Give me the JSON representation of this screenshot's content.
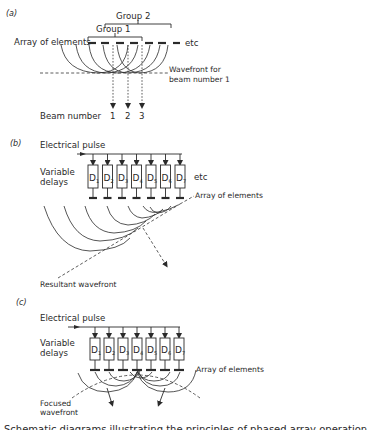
{
  "figure": {
    "panels": [
      {
        "tag": "(a)",
        "labels": {
          "array": "Array of elements",
          "etc": "etc",
          "group1": "Group 1",
          "group2": "Group 2",
          "wavefront_line1": "Wavefront for",
          "wavefront_line2": "beam number 1",
          "beam_number": "Beam number",
          "beams": [
            "1",
            "2",
            "3"
          ]
        }
      },
      {
        "tag": "(b)",
        "labels": {
          "pulse": "Electrical pulse",
          "delays_line1": "Variable",
          "delays_line2": "delays",
          "etc": "etc",
          "array": "Array of elements",
          "resultant": "Resultant wavefront",
          "delay_boxes": [
            "1",
            "2",
            "3",
            "4",
            "5",
            "6",
            "7"
          ],
          "delay_prefix": "D"
        }
      },
      {
        "tag": "(c)",
        "labels": {
          "pulse": "Electrical pulse",
          "delays_line1": "Variable",
          "delays_line2": "delays",
          "array": "Array of elements",
          "focused_line1": "Focused",
          "focused_line2": "wavefront",
          "delay_boxes": [
            "1",
            "2",
            "3",
            "4",
            "5",
            "6",
            "7"
          ],
          "delay_prefix": "D"
        }
      }
    ],
    "caption_partial": "Schematic diagrams illustrating the principles of phased array operation"
  }
}
